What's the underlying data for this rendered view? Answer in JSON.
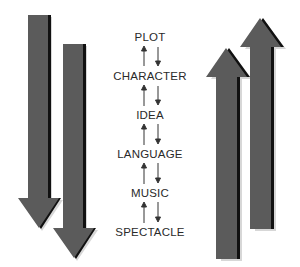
{
  "diagram": {
    "levels": [
      {
        "label": "PLOT"
      },
      {
        "label": "CHARACTER"
      },
      {
        "label": "IDEA"
      },
      {
        "label": "LANGUAGE"
      },
      {
        "label": "MUSIC"
      },
      {
        "label": "SPECTACLE"
      }
    ],
    "left_arrows": {
      "direction": "down",
      "count": 2,
      "color": "#5a5a5a"
    },
    "right_arrows": {
      "direction": "up",
      "count": 2,
      "color": "#5a5a5a"
    },
    "connector_arrows": {
      "left": "up",
      "right": "down"
    }
  }
}
